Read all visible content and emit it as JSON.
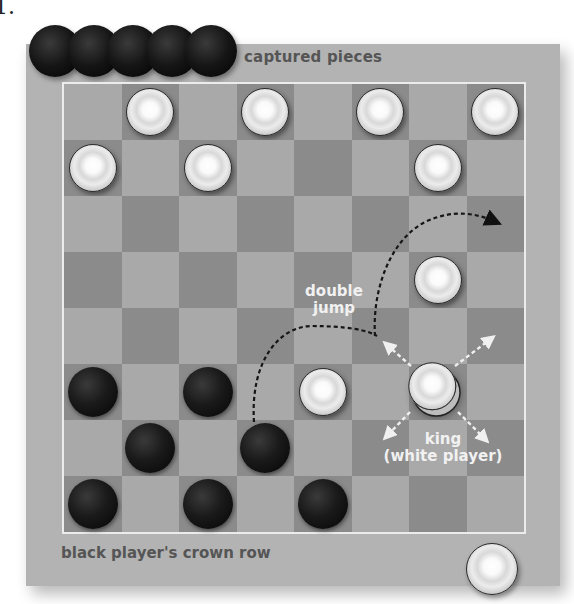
{
  "corner_label": "1.",
  "labels": {
    "captured": "captured pieces",
    "crown_row": "black player's crown row",
    "double_jump_line1": "double",
    "double_jump_line2": "jump",
    "king_line1": "king",
    "king_line2": "(white player)"
  },
  "colors": {
    "frame": "#b3b3b3",
    "light_square": "#a9a9a9",
    "dark_square": "#8b8b8b",
    "board_border": "#ececec",
    "jump_path": "#1a1a1a",
    "king_arrows": "#f0f0f0"
  },
  "captured_pieces": {
    "color": "black",
    "count": 5
  },
  "board": {
    "rows": 8,
    "cols": 8,
    "pieces": [
      {
        "row": 0,
        "col": 1,
        "color": "white"
      },
      {
        "row": 0,
        "col": 3,
        "color": "white"
      },
      {
        "row": 0,
        "col": 5,
        "color": "white"
      },
      {
        "row": 0,
        "col": 7,
        "color": "white"
      },
      {
        "row": 1,
        "col": 0,
        "color": "white"
      },
      {
        "row": 1,
        "col": 2,
        "color": "white"
      },
      {
        "row": 1,
        "col": 6,
        "color": "white"
      },
      {
        "row": 3,
        "col": 6,
        "color": "white"
      },
      {
        "row": 5,
        "col": 0,
        "color": "black"
      },
      {
        "row": 5,
        "col": 2,
        "color": "black"
      },
      {
        "row": 5,
        "col": 4,
        "color": "white"
      },
      {
        "row": 5,
        "col": 6,
        "color": "white",
        "king": true
      },
      {
        "row": 6,
        "col": 1,
        "color": "black"
      },
      {
        "row": 6,
        "col": 3,
        "color": "black"
      },
      {
        "row": 7,
        "col": 0,
        "color": "black"
      },
      {
        "row": 7,
        "col": 2,
        "color": "black"
      },
      {
        "row": 7,
        "col": 4,
        "color": "black"
      }
    ]
  },
  "off_board_piece": {
    "color": "white",
    "position": "below board, right"
  },
  "annotations": {
    "double_jump_path": "dashed arc from black piece (row 6, col 3) over white (row 5, col 4) and white (row 3, col 6) to arrowhead at (row 2, col 7)",
    "king_moves": [
      "up-left",
      "up-right",
      "down-left",
      "down-right"
    ]
  }
}
